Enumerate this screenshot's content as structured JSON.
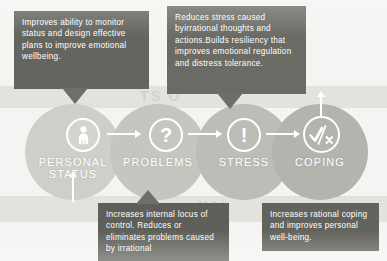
{
  "diagram": {
    "background_label_top": "TS O",
    "background_label_bottom": "NAL",
    "stages": [
      {
        "id": "personal-status",
        "label": "PERSONAL\nSTATUS",
        "icon": "person-icon",
        "glyph": "♀"
      },
      {
        "id": "problems",
        "label": "PROBLEMS",
        "icon": "question-mark-icon",
        "glyph": "?"
      },
      {
        "id": "stress",
        "label": "STRESS",
        "icon": "exclamation-mark-icon",
        "glyph": "!"
      },
      {
        "id": "coping",
        "label": "COPING",
        "icon": "check-slash-x-icon",
        "glyph": "✓"
      }
    ],
    "callouts": [
      {
        "id": "personal-status-callout",
        "position": "top-left",
        "text": "Improves ability to monitor status and design effective plans to improve emotional wellbeing."
      },
      {
        "id": "stress-callout",
        "position": "top-right",
        "text": "Reduces stress caused byirrational thoughts and actions.Builds resiliency that improves emotional regulation and distress tolerance."
      },
      {
        "id": "problems-callout",
        "position": "bottom-center",
        "text": "Increases internal locus of control. Reduces or eliminates problems caused by irrational"
      },
      {
        "id": "coping-callout",
        "position": "bottom-right",
        "text": "Increases rational coping and improves personal well-being."
      }
    ],
    "colors": {
      "callout_fill": "#6e6e6a",
      "circle_fill": "#c6c6c1",
      "accent_text": "#ffffff",
      "canvas": "#f4f4f2"
    }
  }
}
